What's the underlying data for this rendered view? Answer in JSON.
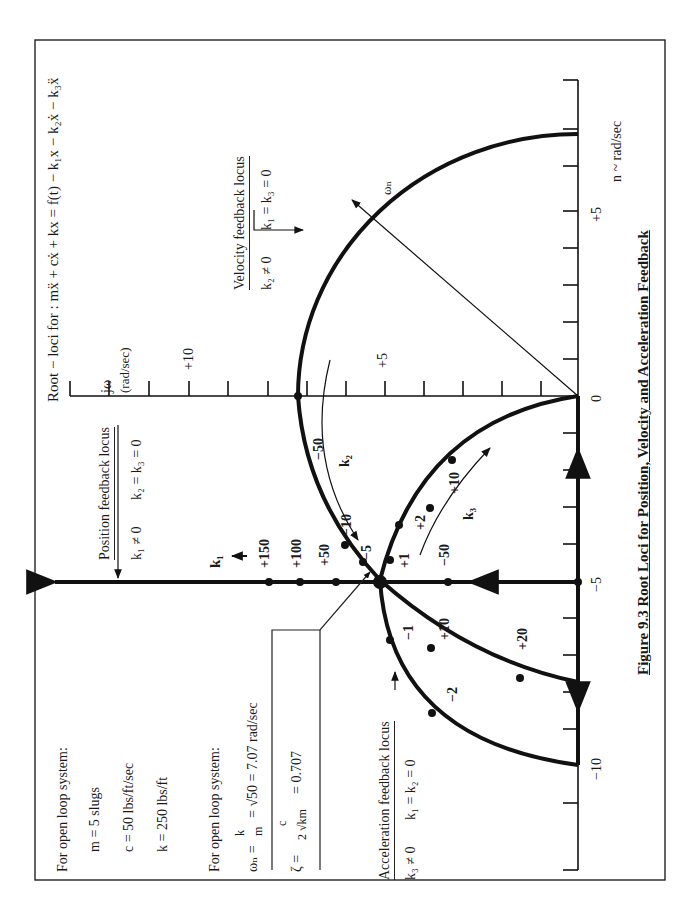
{
  "figure": {
    "title": "Root − loci for : mẍ + cẋ + kx = f(t) − k₁x − k₂ẋ − k₃ẍ",
    "caption": "Figure 9.3 Root Loci for Position, Velocity and Acceleration Feedback"
  },
  "axes": {
    "imag_label": "jω",
    "imag_unit": "(rad/sec)",
    "real_label": "n ~ rad/sec",
    "imag_ticks": [
      {
        "value": 10,
        "label": "+10"
      },
      {
        "value": 5,
        "label": "+5"
      }
    ],
    "real_ticks": [
      {
        "value": 5,
        "label": "+5"
      },
      {
        "value": 0,
        "label": "0"
      },
      {
        "value": -5,
        "label": "−5"
      },
      {
        "value": -10,
        "label": "−10"
      }
    ]
  },
  "loci": {
    "position": {
      "title": "Position feedback locus",
      "condition_a": "k₁ ≠ 0",
      "condition_b": "k₂ = k₃ = 0",
      "gain_symbol": "k₁",
      "points": [
        "+150",
        "+100",
        "+50",
        "−50"
      ]
    },
    "velocity": {
      "title": "Velocity feedback locus",
      "condition_a": "k₂ ≠ 0",
      "condition_b": "k₁ = k₃ = 0",
      "gain_symbol": "k₂",
      "points": [
        "−50",
        "−10",
        "−5"
      ],
      "radius_label": "ωₙ"
    },
    "acceleration": {
      "title": "Acceleration feedback locus",
      "condition_a": "k₃ ≠ 0",
      "condition_b": "k₁ = k₂ = 0",
      "gain_symbol": "k₃",
      "points": [
        "+1",
        "+2",
        "+10",
        "−1",
        "−2",
        "+10",
        "+20"
      ]
    }
  },
  "open_loop": {
    "heading": "For open loop system:",
    "m": "m = 5 slugs",
    "c": "c = 50 lbs/ft/sec",
    "k": "k = 250 lbs/ft",
    "heading2": "For open loop system:",
    "omega_lhs": "ωₙ =",
    "omega_rhs": "= √50 = 7.07 rad/sec",
    "omega_frac_num": "k",
    "omega_frac_den": "m",
    "zeta_lhs": "ζ =",
    "zeta_num": "c",
    "zeta_den": "2 √km",
    "zeta_rhs": "= 0.707"
  },
  "colors": {
    "ink": "#111111",
    "background": "#ffffff"
  }
}
